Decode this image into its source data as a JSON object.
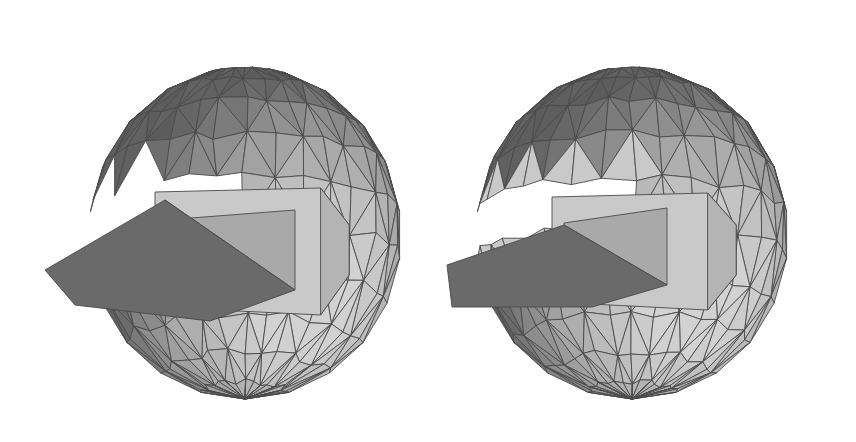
{
  "figure": {
    "panels": [
      {
        "id": "left",
        "label": "",
        "notch": "wide wedge opening with inclined floor",
        "has_band": false
      },
      {
        "id": "right",
        "label": "",
        "notch": "narrow slit with lighter ring band around cut",
        "has_band": true
      }
    ],
    "colors": {
      "background": "#ffffff",
      "edge": "#4a4a4a",
      "dark_face": "#6e6e6e",
      "mid_face": "#8f8f8f",
      "light_face": "#b4b4b4",
      "lightest_face": "#c9c9c9",
      "notch_floor": "#6a6a6a",
      "notch_wall": "#a9a9a9"
    }
  }
}
